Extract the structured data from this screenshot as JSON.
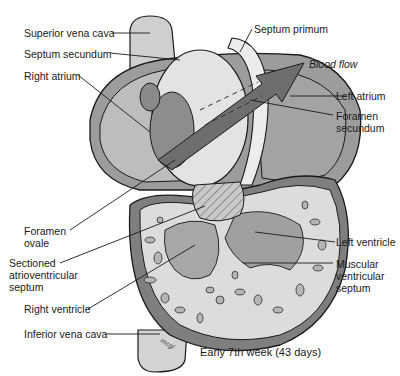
{
  "diagram": {
    "caption": "Early 7th week (43 days)",
    "labels": {
      "superior_vena_cava": "Superior vena cava",
      "septum_secundum": "Septum secundum",
      "right_atrium": "Right atrium",
      "septum_primum": "Septum primum",
      "blood_flow": "Blood flow",
      "left_atrium": "Left atrium",
      "foramen_secundum": "Foramen\nsecundum",
      "foramen_ovale": "Foramen\novale",
      "sectioned_av_septum": "Sectioned\natrioventricular\nseptum",
      "left_ventricle": "Left ventricle",
      "muscular_ventricular_septum": "Muscular\nventricular\nseptum",
      "right_ventricle": "Right ventricle",
      "inferior_vena_cava": "Inferior vena cava"
    },
    "colors": {
      "outline": "#1a1a1a",
      "light_fill": "#d9d9d9",
      "mid_fill": "#a8a8a8",
      "dark_fill": "#7a7a7a",
      "arrow_fill": "#6e6e6e",
      "background": "#ffffff"
    }
  }
}
